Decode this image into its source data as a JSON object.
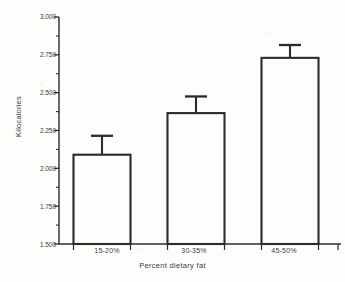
{
  "figure": {
    "background_color": "#fdfdfc",
    "ink_color": "#2b2b2b"
  },
  "axis": {
    "y_title": "Kilocalories",
    "x_title": "Percent dietary fat",
    "y_ticks": [
      "3.000",
      "2.750",
      "2.500",
      "2.250",
      "2.000",
      "1.750",
      "1.500"
    ],
    "x_ticks": [
      "15-20%",
      "30-35%",
      "45-50%"
    ]
  },
  "chart_data": {
    "type": "bar",
    "title": "",
    "subtitle": "",
    "xlabel": "Percent dietary fat",
    "ylabel": "Kilocalories",
    "categories": [
      "15-20%",
      "30-35%",
      "45-50%"
    ],
    "values": [
      2090,
      2365,
      2730
    ],
    "errors": [
      125,
      110,
      85
    ],
    "error_type": "symmetric-upper-cap-only",
    "ylim": [
      1500,
      3000
    ],
    "ytick_values": [
      1500,
      1750,
      2000,
      2250,
      2500,
      2750,
      3000
    ],
    "ytick_labels": [
      "1.500",
      "1.750",
      "2.000",
      "2.250",
      "2.500",
      "2.750",
      "3.000"
    ],
    "grid": false,
    "legend": null,
    "bar_fill": "none",
    "bar_edge_color": "#2b2b2b",
    "series": [
      {
        "name": "Kilocalories",
        "values": [
          2090,
          2365,
          2730
        ],
        "errors": [
          125,
          110,
          85
        ]
      }
    ],
    "annotations": []
  }
}
